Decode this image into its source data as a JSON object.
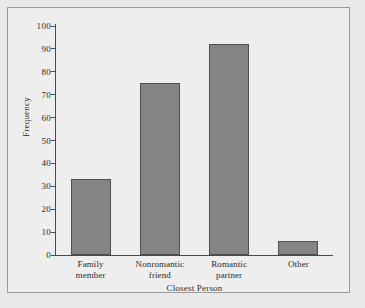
{
  "figure": {
    "background_color": "#e9e9e9",
    "plot_background_color": "#eeeeee",
    "frame_color": "#9a9a9a",
    "axis_color": "#4a4a4a"
  },
  "chart_data": {
    "type": "bar",
    "title": "",
    "subtitle": "",
    "xlabel": "Closest Person",
    "ylabel": "Frequency",
    "categories": [
      "Family member",
      "Nonromantic friend",
      "Romantic partner",
      "Other"
    ],
    "category_lines": [
      [
        "Family",
        "member"
      ],
      [
        "Nonromantic",
        "friend"
      ],
      [
        "Romantic",
        "partner"
      ],
      [
        "Other"
      ]
    ],
    "values": [
      33,
      75,
      92,
      6
    ],
    "ylim": [
      0,
      100
    ],
    "ytick_labels": [
      "0",
      "10",
      "20",
      "30",
      "40",
      "50",
      "60",
      "70",
      "80",
      "90",
      "100"
    ],
    "ytick_values": [
      0,
      10,
      20,
      30,
      40,
      50,
      60,
      70,
      80,
      90,
      100
    ],
    "grid": false,
    "legend": null,
    "bar_fill_color": "#848484",
    "bar_edge_color": "#4f4f4f",
    "annotations": []
  }
}
